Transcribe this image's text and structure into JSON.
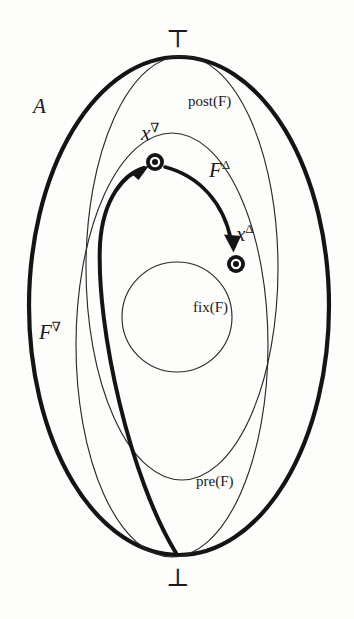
{
  "figure": {
    "kind": "lattice-fixpoint-diagram",
    "background_color": "#fdfdfc",
    "ink_color": "#1a1a1a"
  },
  "labels": {
    "top_element": "⊤",
    "bottom_element": "⊥",
    "universe": "A",
    "post_set": "post(F)",
    "fix_set": "fix(F)",
    "pre_set": "pre(F)",
    "point_greatest_base": "x",
    "point_greatest_sup": "∇",
    "point_least_base": "x",
    "point_least_sup": "Δ",
    "map_up_base": "F",
    "map_up_sup": "Δ",
    "map_down_base": "F",
    "map_down_sup": "∇"
  },
  "shapes": {
    "outer_ellipse": {
      "name": "A",
      "stroke": "#141414",
      "stroke_width": 4.2,
      "cx": 179,
      "cy": 306,
      "rx": 150,
      "ry": 249
    },
    "post_ellipse": {
      "name": "post(F)",
      "stroke": "#2a2a2a",
      "stroke_width": 1.1,
      "cx": 182,
      "cy": 268,
      "rx": 96,
      "ry": 212
    },
    "pre_ellipse": {
      "name": "pre(F)",
      "stroke": "#2a2a2a",
      "stroke_width": 1.1,
      "cx": 172,
      "cy": 345,
      "rx": 96,
      "ry": 212
    },
    "fix_circle": {
      "name": "fix(F)",
      "stroke": "#2a2a2a",
      "stroke_width": 1.1,
      "cx": 177,
      "cy": 317,
      "r": 55
    },
    "dot_greatest": {
      "cx": 155,
      "cy": 162,
      "outer_r": 9,
      "inner_r": 4
    },
    "dot_least": {
      "cx": 236,
      "cy": 264,
      "outer_r": 9,
      "inner_r": 4
    }
  },
  "arrows": {
    "map_up": {
      "name": "F-nabla",
      "from": "⊥",
      "to": "x-nabla",
      "stroke_width": 4.0
    },
    "map_down": {
      "name": "F-delta",
      "from": "x-nabla",
      "to": "x-delta",
      "stroke_width": 3.6
    }
  }
}
